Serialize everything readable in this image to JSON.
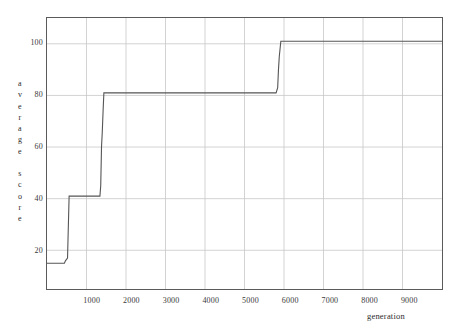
{
  "chart_data": {
    "type": "line",
    "title": "",
    "subtitle": "",
    "xlabel": "generation",
    "ylabel": "average score",
    "ylabel_chars": [
      "a",
      "v",
      "e",
      "r",
      "a",
      "g",
      "e",
      "",
      "s",
      "c",
      "o",
      "r",
      "e"
    ],
    "xlim": [
      0,
      10000
    ],
    "ylim": [
      5,
      110
    ],
    "xticks": [
      1000,
      2000,
      3000,
      4000,
      5000,
      6000,
      7000,
      8000,
      9000
    ],
    "xtick_labels": [
      "1000",
      "2000",
      "3000",
      "4000",
      "5000",
      "6000",
      "7000",
      "8000",
      "9000"
    ],
    "yticks": [
      20,
      40,
      60,
      80,
      100
    ],
    "ytick_labels": [
      "20",
      "40",
      "60",
      "80",
      "100"
    ],
    "grid": true,
    "legend": "none",
    "line_color": "#555555",
    "grid_color": "#c8c8c8",
    "frame_color": "#5a5a5a",
    "background_color": "#ffffff",
    "series": [
      {
        "name": "average score",
        "step": true,
        "x": [
          0,
          440,
          470,
          520,
          560,
          1340,
          1360,
          1380,
          1400,
          1420,
          1440,
          5800,
          5840,
          5860,
          5880,
          5900,
          5920,
          10000
        ],
        "y": [
          15,
          15,
          16,
          17,
          41,
          41,
          45,
          60,
          66,
          74,
          81,
          81,
          83,
          90,
          95,
          98,
          101,
          101
        ]
      }
    ],
    "annotations": []
  }
}
